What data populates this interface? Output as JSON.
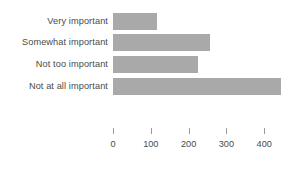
{
  "chart_data": {
    "type": "bar",
    "orientation": "horizontal",
    "title": "",
    "subtitle": "",
    "xlabel": "",
    "ylabel": "",
    "categories": [
      "Very important",
      "Somewhat important",
      "Not too important",
      "Not at all important"
    ],
    "values": [
      117,
      257,
      225,
      444
    ],
    "series": [
      {
        "name": "",
        "values": [
          117,
          257,
          225,
          444
        ]
      }
    ],
    "xticks": [
      0,
      100,
      200,
      300,
      400
    ],
    "xtick_labels": [
      "0",
      "100",
      "200",
      "300",
      "400"
    ],
    "xlim": [
      0,
      460
    ],
    "grid": false,
    "legend": false,
    "legend_position": "none",
    "bar_color": "#a9a9a9",
    "text_color": "#4a4a4a",
    "background_color": "#ffffff",
    "axis_line": false,
    "annotations": []
  }
}
